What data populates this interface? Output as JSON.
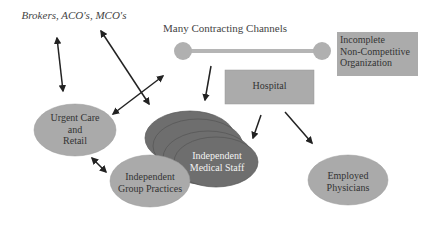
{
  "title": "Many Contracting Channels",
  "nodes": {
    "brokers": "Brokers, ACO's, MCO's",
    "channels": "Many Contracting Channels",
    "incomplete": [
      "Incomplete",
      "Non-Competitive",
      "Organization"
    ],
    "hospital": "Hospital",
    "urgent_care": [
      "Urgent Care",
      "and",
      "Retail"
    ],
    "independent_group": [
      "Independent",
      "Group Practices"
    ],
    "independent_medical": [
      "Independent",
      "Medical Staff"
    ],
    "employed": [
      "Employed",
      "Physicians"
    ]
  },
  "colors": {
    "light_fill": "#a9a9a9",
    "dark_fill": "#6e6e6e",
    "box_fill": "#ababab",
    "connector": "#b0b0b0",
    "arrow": "#222222"
  }
}
